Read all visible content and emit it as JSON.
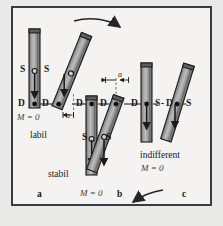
{
  "figure": {
    "title_alt": "Equilibrium states of a pivoted bar",
    "frame": {
      "border_color": "#3a3a42",
      "fill": "#f4f3f1",
      "page_bg": "#e9e9e7"
    },
    "bar_style": {
      "fill": "#8c8c8c",
      "edge": "#1b1b1b",
      "highlight": "#b9b9b9"
    }
  },
  "labels": {
    "pivot": "D",
    "centroid": "S",
    "moment_zero": "M = 0",
    "offset": "a"
  },
  "states": {
    "labil": "labil",
    "stabil": "stabil",
    "indifferent": "indifferent"
  },
  "captions": {
    "a": "a",
    "b": "b",
    "c": "c"
  },
  "right_group_text": {
    "s_left": "S",
    "d_mid": "D",
    "s_right": "S",
    "dash": "-"
  },
  "icons": {
    "top_arrow": "curved-arrow-right",
    "bottom_arrow": "curved-arrow-left",
    "weight_arrow": "down-arrow",
    "dimension_arrow": "dimension-arrow"
  },
  "markers": {
    "pivot_dot": "filled-circle",
    "centroid_circle": "open-circle"
  },
  "columns": [
    {
      "id": "a",
      "state": "labil",
      "moment": "M = 0"
    },
    {
      "id": "b",
      "state": "stabil",
      "moment": "M = 0"
    },
    {
      "id": "c",
      "state": "indifferent",
      "moment": "M = 0"
    }
  ]
}
